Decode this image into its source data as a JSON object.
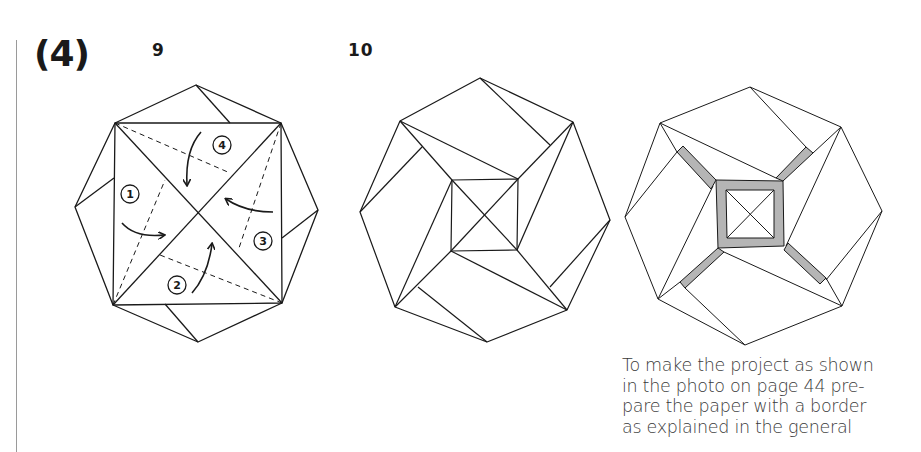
{
  "page": {
    "step_label": "(4)",
    "figures": [
      {
        "number": "9"
      },
      {
        "number": "10"
      },
      {
        "number": ""
      }
    ],
    "caption_lines": [
      "To make the project as shown",
      "in the photo on page 44 pre-",
      "pare the paper with a border",
      "as explained in the general"
    ],
    "fold_steps": [
      "1",
      "2",
      "3",
      "4"
    ]
  },
  "colors": {
    "ink": "#1a1a1a",
    "shade": "#b5b5b5",
    "caption": "#3a3a3a",
    "rule": "#9a9a9a"
  }
}
